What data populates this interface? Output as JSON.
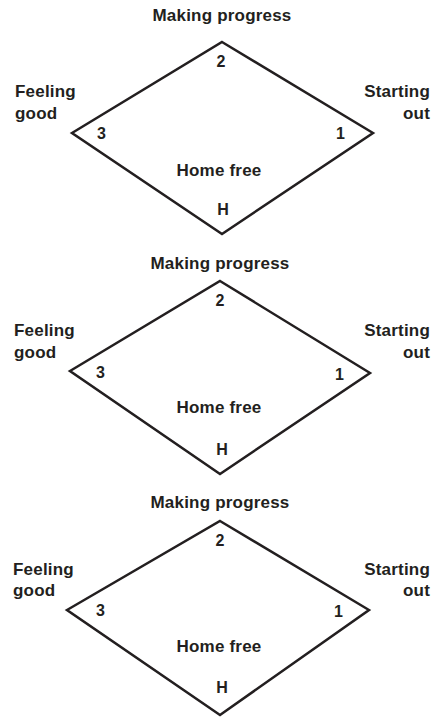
{
  "diagrams": [
    {
      "top_label": "Making progress",
      "left_label_line1": "Feeling",
      "left_label_line2": "good",
      "right_label_line1": "Starting",
      "right_label_line2": "out",
      "center_label": "Home free",
      "vertex_top": "2",
      "vertex_left": "3",
      "vertex_right": "1",
      "vertex_bottom": "H"
    },
    {
      "top_label": "Making progress",
      "left_label_line1": "Feeling",
      "left_label_line2": "good",
      "right_label_line1": "Starting",
      "right_label_line2": "out",
      "center_label": "Home free",
      "vertex_top": "2",
      "vertex_left": "3",
      "vertex_right": "1",
      "vertex_bottom": "H"
    },
    {
      "top_label": "Making progress",
      "left_label_line1": "Feeling",
      "left_label_line2": "good",
      "right_label_line1": "Starting",
      "right_label_line2": "out",
      "center_label": "Home free",
      "vertex_top": "2",
      "vertex_left": "3",
      "vertex_right": "1",
      "vertex_bottom": "H"
    }
  ],
  "colors": {
    "ink": "#231f20",
    "background": "#ffffff"
  }
}
